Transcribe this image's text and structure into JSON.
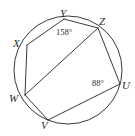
{
  "figure": {
    "type": "inscribed-hexagon-in-circle",
    "stroke_color": "#3a3a3a",
    "background_color": "#ffffff",
    "circle": {
      "cx": 68,
      "cy": 70,
      "r": 54
    },
    "vertices": [
      {
        "id": "X",
        "label": "X",
        "x": 27,
        "y": 45,
        "label_x": 13,
        "label_y": 38
      },
      {
        "id": "Y",
        "label": "Y",
        "x": 64,
        "y": 19,
        "label_x": 60,
        "label_y": 8
      },
      {
        "id": "Z",
        "label": "Z",
        "x": 98,
        "y": 28,
        "label_x": 99,
        "label_y": 16
      },
      {
        "id": "U",
        "label": "U",
        "x": 120,
        "y": 84,
        "label_x": 122,
        "label_y": 80
      },
      {
        "id": "V",
        "label": "V",
        "x": 48,
        "y": 120,
        "label_x": 41,
        "label_y": 120
      },
      {
        "id": "W",
        "label": "W",
        "x": 25,
        "y": 95,
        "label_x": 9,
        "label_y": 93
      }
    ],
    "edges": [
      {
        "from": "X",
        "to": "Y"
      },
      {
        "from": "Y",
        "to": "Z"
      },
      {
        "from": "Z",
        "to": "U"
      },
      {
        "from": "U",
        "to": "V"
      },
      {
        "from": "V",
        "to": "W"
      },
      {
        "from": "W",
        "to": "X"
      }
    ],
    "diagonals": [
      {
        "from": "W",
        "to": "Z"
      }
    ],
    "angles": [
      {
        "id": "angle-Y",
        "at_vertex": "Y",
        "value": "158°",
        "measure": 158,
        "unit": "degrees",
        "label_x": 56,
        "label_y": 28
      },
      {
        "id": "angle-U",
        "at_vertex": "U",
        "value": "88°",
        "measure": 88,
        "unit": "degrees",
        "label_x": 92,
        "label_y": 79
      }
    ]
  }
}
